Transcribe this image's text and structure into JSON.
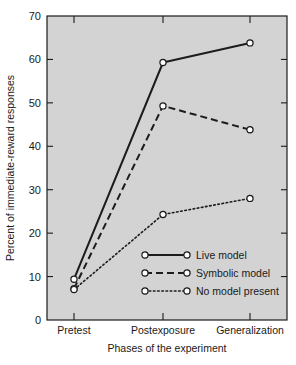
{
  "chart_data": {
    "type": "line",
    "title": "",
    "xlabel": "Phases of the experiment",
    "ylabel": "Percent of immediate-reward responses",
    "categories": [
      "Pretest",
      "Postexposure",
      "Generalization"
    ],
    "ylim": [
      0,
      70
    ],
    "yticks": [
      0,
      10,
      20,
      30,
      40,
      50,
      60,
      70
    ],
    "ytick_labels": [
      "0",
      "10",
      "20",
      "30",
      "40",
      "50",
      "60",
      "70"
    ],
    "grid": false,
    "legend_position": "inside-lower-right",
    "series": [
      {
        "name": "Live model",
        "style": "solid",
        "marker": "open-circle",
        "values": [
          9.4,
          59.3,
          63.8
        ]
      },
      {
        "name": "Symbolic model",
        "style": "dashed",
        "marker": "open-circle",
        "values": [
          7.2,
          49.3,
          43.8
        ]
      },
      {
        "name": "No model present",
        "style": "dotted",
        "marker": "open-circle",
        "values": [
          7.0,
          24.3,
          28.0
        ]
      }
    ],
    "colors": {
      "line": "#1c1c1c",
      "marker_fill": "#ffffff",
      "plot_background": "#d3d3d3",
      "page_background": "#ffffff",
      "axis": "#1c1c1c"
    }
  },
  "axes": {
    "y_title": "Percent of immediate-reward responses",
    "x_title": "Phases of the experiment",
    "y_ticks": [
      "0",
      "10",
      "20",
      "30",
      "40",
      "50",
      "60",
      "70"
    ],
    "x_ticks": [
      "Pretest",
      "Postexposure",
      "Generalization"
    ]
  },
  "legend": {
    "entries": [
      {
        "label": "Live model",
        "style": "solid"
      },
      {
        "label": "Symbolic model",
        "style": "dashed"
      },
      {
        "label": "No model present",
        "style": "dotted"
      }
    ]
  }
}
